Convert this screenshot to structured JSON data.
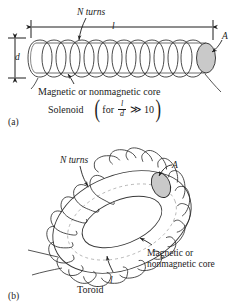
{
  "figure": {
    "background_color": "#ffffff",
    "ink_color": "#1c1c1c",
    "shade_color": "#c9c9c9"
  },
  "panel_a": {
    "tag": "(a)",
    "name": "Solenoid",
    "turns_label": "N turns",
    "length_label": "l",
    "area_label": "A",
    "diameter_label": "d",
    "core_label": "Magnetic or nonmagnetic core",
    "condition": {
      "open_paren": "(",
      "for_word": "for",
      "numerator": "l",
      "denominator": "d",
      "relation": "≫",
      "value": "10",
      "close_paren": ")"
    }
  },
  "panel_b": {
    "tag": "(b)",
    "name": "Toroid",
    "turns_label": "N turns",
    "length_label": "l",
    "area_label": "A",
    "core_label_line1": "Magnetic or",
    "core_label_line2": "nonmagnetic core"
  }
}
